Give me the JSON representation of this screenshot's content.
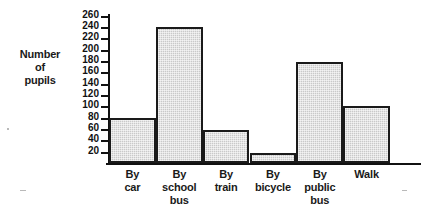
{
  "chart_data": {
    "type": "bar",
    "title": "",
    "xlabel": "",
    "ylabel": "Number of pupils",
    "ylabel_lines": [
      "Number",
      "of",
      "pupils"
    ],
    "categories": [
      "By car",
      "By school bus",
      "By train",
      "By bicycle",
      "By public bus",
      "Walk"
    ],
    "category_lines": [
      [
        "By",
        "car"
      ],
      [
        "By",
        "school",
        "bus"
      ],
      [
        "By",
        "train"
      ],
      [
        "By",
        "bicycle"
      ],
      [
        "By",
        "public",
        "bus"
      ],
      [
        "Walk"
      ]
    ],
    "values": [
      80,
      240,
      58,
      18,
      178,
      100
    ],
    "ylim": [
      0,
      265
    ],
    "ytick_values": [
      20,
      40,
      60,
      80,
      100,
      120,
      140,
      160,
      180,
      200,
      220,
      240,
      260
    ],
    "ytick_labels": [
      "20",
      "40",
      "60",
      "80",
      "100",
      "120",
      "140",
      "160",
      "180",
      "200",
      "220",
      "240",
      "260"
    ],
    "grid": false,
    "legend": false,
    "legend_position": "none",
    "bar_fill_color": "#c9c9c9",
    "bar_edge_color": "#1a1a1a",
    "axis_color": "#111111",
    "background_color": "#ffffff"
  }
}
